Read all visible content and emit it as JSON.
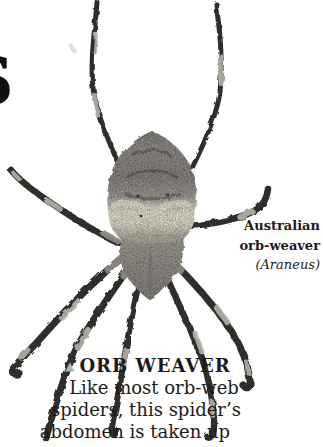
{
  "page": {
    "partial_heading_letter": "S"
  },
  "species_label": {
    "line1": "Australian",
    "line2": "orb-weaver",
    "genus": "(Araneus)"
  },
  "caption": {
    "marker": "▲",
    "title": "ORB WEAVER",
    "lines": [
      "Like most orb-web",
      "spiders, this spider’s",
      "abdomen is taken up"
    ]
  },
  "colors": {
    "background": "#ffffff",
    "text": "#1c1b19",
    "triangle_marker": "#b5b3b0",
    "leg_dark": "#2f2d2a",
    "leg_light_band": "#b6b1a8",
    "abdomen_gray": "#8f8c85",
    "abdomen_cream_band": "#e9e4d2"
  }
}
